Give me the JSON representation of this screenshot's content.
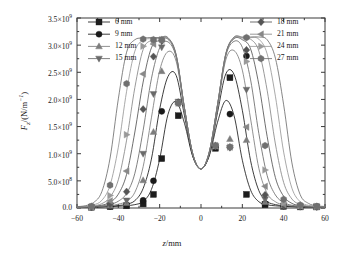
{
  "chart_data": {
    "type": "line",
    "title": "",
    "xlabel": "z/mm",
    "ylabel": "F_z/(N/m^-1)",
    "xlabel_parts": {
      "sym": "z",
      "unit": "/mm"
    },
    "ylabel_parts": {
      "sym": "F",
      "sub": "z",
      "unit": "/(N/m",
      "sup": "-1",
      "tail": ")"
    },
    "xlim": [
      -60,
      60
    ],
    "ylim": [
      0,
      3500000000.0
    ],
    "xticks": [
      -60,
      -40,
      -20,
      0,
      20,
      40,
      60
    ],
    "xticklabels": [
      "-60",
      "-40",
      "-20",
      "0",
      "20",
      "40",
      "60"
    ],
    "yticks": [
      0,
      500000000,
      1000000000,
      1500000000,
      2000000000,
      2500000000,
      3000000000,
      3500000000
    ],
    "yticklabels": [
      "0.0",
      "5.0×10⁸",
      "1.0×10⁹",
      "1.5×10⁹",
      "2.0×10⁹",
      "2.5×10⁹",
      "3.0×10⁹",
      "3.5×10⁹"
    ],
    "grid": false,
    "minor_ticks": true,
    "tick_direction": "in",
    "legend_position": "top-split-two-columns",
    "x": [
      -60,
      -56,
      -52,
      -48,
      -44,
      -40,
      -36,
      -32,
      -28,
      -24,
      -20,
      -16,
      -12,
      -8,
      -4,
      0,
      4,
      8,
      12,
      16,
      20,
      24,
      28,
      32,
      36,
      40,
      44,
      48,
      52,
      56,
      60
    ],
    "series": [
      {
        "name": "6 mm",
        "marker": "square",
        "color": "#1d1d1d",
        "marker_x": [
          -53,
          -44,
          -36,
          -28,
          -23,
          -19,
          -11,
          7,
          14,
          22,
          31,
          40,
          48,
          56
        ],
        "marker_y": [
          15000000,
          25000000,
          40000000,
          75000000,
          250000000,
          910000000,
          1700000000,
          1100000000,
          2400000000,
          250000000,
          60000000,
          30000000,
          20000000,
          20000000
        ],
        "values": [
          10000000,
          12000000,
          15000000,
          20000000,
          25000000,
          32000000,
          42000000,
          62000000,
          120000000,
          340000000,
          900000000,
          1720000000,
          1960000000,
          1560000000,
          950000000,
          720000000,
          960000000,
          1580000000,
          1980000000,
          1700000000,
          880000000,
          330000000,
          115000000,
          60000000,
          40000000,
          30000000,
          24000000,
          19000000,
          15000000,
          13000000,
          11000000
        ]
      },
      {
        "name": "9 mm",
        "marker": "circle",
        "color": "#1a1a1a",
        "marker_x": [
          -53,
          -44,
          -36,
          -28,
          -23,
          -19,
          -11,
          7,
          14,
          22,
          31,
          40,
          48,
          56
        ],
        "marker_y": [
          15000000,
          30000000,
          55000000,
          140000000,
          500000000,
          1780000000,
          1950000000,
          1120000000,
          1730000000,
          2800000000,
          80000000,
          35000000,
          22000000,
          20000000
        ],
        "values": [
          11000000,
          13000000,
          17000000,
          23000000,
          31000000,
          45000000,
          70000000,
          135000000,
          360000000,
          900000000,
          1820000000,
          2420000000,
          2440000000,
          1700000000,
          960000000,
          720000000,
          980000000,
          1760000000,
          2470000000,
          2460000000,
          1800000000,
          870000000,
          320000000,
          120000000,
          62000000,
          40000000,
          28000000,
          21000000,
          17000000,
          14000000,
          12000000
        ]
      },
      {
        "name": "12 mm",
        "marker": "triangle-up",
        "color": "#7d7d7d",
        "marker_x": [
          -53,
          -44,
          -36,
          -28,
          -23,
          -19,
          -11,
          7,
          14,
          22,
          31,
          40,
          48,
          56
        ],
        "marker_y": [
          15000000,
          40000000,
          90000000,
          510000000,
          1400000000,
          2520000000,
          1950000000,
          1130000000,
          1270000000,
          1250000000,
          110000000,
          40000000,
          25000000,
          20000000
        ],
        "values": [
          12000000,
          15000000,
          20000000,
          28000000,
          42000000,
          70000000,
          125000000,
          290000000,
          760000000,
          1660000000,
          2530000000,
          2880000000,
          2700000000,
          1800000000,
          990000000,
          720000000,
          1010000000,
          1850000000,
          2730000000,
          2900000000,
          2540000000,
          1640000000,
          730000000,
          270000000,
          115000000,
          58000000,
          36000000,
          25000000,
          19000000,
          16000000,
          13000000
        ]
      },
      {
        "name": "15 mm",
        "marker": "triangle-down",
        "color": "#6a6a6a",
        "marker_x": [
          -53,
          -44,
          -36,
          -28,
          -23,
          -19,
          -11,
          7,
          14,
          22,
          31,
          40,
          48,
          56
        ],
        "marker_y": [
          18000000,
          55000000,
          140000000,
          1000000000,
          2100000000,
          2960000000,
          1960000000,
          1140000000,
          1110000000,
          2180000000,
          160000000,
          45000000,
          27000000,
          22000000
        ],
        "values": [
          13000000,
          17000000,
          24000000,
          38000000,
          65000000,
          125000000,
          270000000,
          640000000,
          1430000000,
          2380000000,
          2950000000,
          3060000000,
          2770000000,
          1830000000,
          1000000000,
          720000000,
          1020000000,
          1880000000,
          2800000000,
          3070000000,
          2960000000,
          2360000000,
          1370000000,
          600000000,
          240000000,
          100000000,
          50000000,
          32000000,
          23000000,
          18000000,
          15000000
        ]
      },
      {
        "name": "18 mm",
        "marker": "diamond",
        "color": "#555555",
        "marker_x": [
          -53,
          -44,
          -36,
          -28,
          -23,
          -19,
          -11,
          7,
          14,
          22,
          31,
          40,
          48,
          56
        ],
        "marker_y": [
          20000000,
          80000000,
          300000000,
          1820000000,
          2790000000,
          3080000000,
          1940000000,
          1150000000,
          1120000000,
          2910000000,
          240000000,
          55000000,
          30000000,
          24000000
        ],
        "values": [
          15000000,
          20000000,
          30000000,
          52000000,
          105000000,
          255000000,
          620000000,
          1400000000,
          2320000000,
          2950000000,
          3090000000,
          3110000000,
          2800000000,
          1840000000,
          1000000000,
          720000000,
          1030000000,
          1900000000,
          2830000000,
          3120000000,
          3100000000,
          2930000000,
          2270000000,
          1320000000,
          560000000,
          215000000,
          85000000,
          42000000,
          28000000,
          21000000,
          17000000
        ]
      },
      {
        "name": "21 mm",
        "marker": "triangle-left",
        "color": "#888888",
        "marker_x": [
          -53,
          -44,
          -36,
          -28,
          -23,
          -19,
          -11,
          7,
          14,
          22,
          31,
          40,
          48,
          56
        ],
        "marker_y": [
          22000000,
          130000000,
          680000000,
          2470000000,
          3020000000,
          3090000000,
          1930000000,
          1150000000,
          1120000000,
          1490000000,
          400000000,
          70000000,
          34000000,
          26000000
        ],
        "values": [
          17000000,
          24000000,
          40000000,
          80000000,
          200000000,
          520000000,
          1250000000,
          2220000000,
          2920000000,
          3090000000,
          3120000000,
          3120000000,
          2810000000,
          1840000000,
          1000000000,
          720000000,
          1030000000,
          1900000000,
          2840000000,
          3130000000,
          3130000000,
          3110000000,
          2890000000,
          2170000000,
          1180000000,
          470000000,
          165000000,
          65000000,
          36000000,
          26000000,
          20000000
        ]
      },
      {
        "name": "24 mm",
        "marker": "triangle-right",
        "color": "#999999",
        "marker_x": [
          -53,
          -44,
          -36,
          -28,
          -23,
          -19,
          -11,
          7,
          14,
          22,
          31,
          40,
          48,
          56
        ],
        "marker_y": [
          26000000,
          230000000,
          1350000000,
          2980000000,
          3090000000,
          3100000000,
          1930000000,
          1150000000,
          1120000000,
          2700000000,
          700000000,
          95000000,
          40000000,
          28000000
        ],
        "values": [
          20000000,
          30000000,
          58000000,
          140000000,
          420000000,
          1120000000,
          2150000000,
          2890000000,
          3090000000,
          3120000000,
          3130000000,
          3130000000,
          2820000000,
          1840000000,
          1000000000,
          720000000,
          1030000000,
          1900000000,
          2840000000,
          3140000000,
          3140000000,
          3140000000,
          3110000000,
          2840000000,
          2060000000,
          1030000000,
          365000000,
          115000000,
          50000000,
          32000000,
          23000000
        ]
      },
      {
        "name": "27 mm",
        "marker": "hexagon",
        "color": "#707070",
        "marker_x": [
          -53,
          -44,
          -36,
          -28,
          -23,
          -19,
          -11,
          7,
          14,
          22,
          31,
          40,
          48,
          56
        ],
        "marker_y": [
          32000000,
          420000000,
          2290000000,
          3110000000,
          3100000000,
          3100000000,
          1930000000,
          1150000000,
          1120000000,
          3140000000,
          1150000000,
          160000000,
          55000000,
          32000000
        ],
        "values": [
          25000000,
          42000000,
          100000000,
          300000000,
          920000000,
          2010000000,
          2870000000,
          3100000000,
          3130000000,
          3140000000,
          3140000000,
          3140000000,
          2820000000,
          1840000000,
          1000000000,
          720000000,
          1030000000,
          1900000000,
          2840000000,
          3150000000,
          3150000000,
          3150000000,
          3150000000,
          3100000000,
          2760000000,
          1900000000,
          830000000,
          245000000,
          85000000,
          42000000,
          28000000
        ]
      }
    ],
    "legend_columns": [
      {
        "items": [
          "6 mm",
          "9 mm",
          "12 mm",
          "15 mm"
        ]
      },
      {
        "items": [
          "18 mm",
          "21 mm",
          "24 mm",
          "27 mm"
        ]
      }
    ]
  },
  "figure": {
    "background": "#ffffff",
    "frame_color": "#3a3a3a"
  }
}
